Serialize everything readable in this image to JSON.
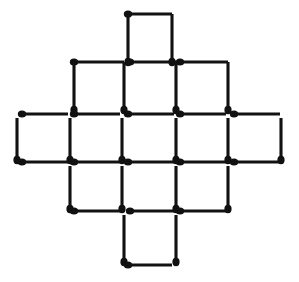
{
  "figure": {
    "title": "Matchstick grid figure",
    "shape_name": "matchstick-diamond-grid",
    "background_color": "#ffffff",
    "match_color": "#121212",
    "head_color": "#111111",
    "canvas": {
      "width": 299,
      "height": 282
    },
    "geometry": {
      "columns_x": [
        20,
        64,
        108,
        152,
        196,
        240,
        284
      ],
      "rows_y": [
        14,
        62,
        114,
        162,
        211,
        265
      ],
      "match_length_h": 44,
      "match_length_v": 44,
      "stick_thickness": 3.1,
      "head_radius_x": 4.2,
      "head_radius_y": 3.6
    },
    "counts": {
      "cells_total": 13,
      "cells_per_row": [
        1,
        3,
        5,
        3,
        1
      ],
      "matches_total": 40
    },
    "matches": [
      {
        "id": "h-r0-c2",
        "orientation": "horizontal",
        "x1": 128,
        "y1": 14,
        "x2": 172,
        "y2": 14,
        "head_at": "start"
      },
      {
        "id": "v-r0-c2-left",
        "orientation": "vertical",
        "x1": 128,
        "y1": 14,
        "x2": 128,
        "y2": 62,
        "head_at": "end"
      },
      {
        "id": "v-r0-c2-right",
        "orientation": "vertical",
        "x1": 172,
        "y1": 14,
        "x2": 172,
        "y2": 62,
        "head_at": "end"
      },
      {
        "id": "h-r1-c1",
        "orientation": "horizontal",
        "x1": 74,
        "y1": 62,
        "x2": 124,
        "y2": 62,
        "head_at": "start"
      },
      {
        "id": "h-r1-c2",
        "orientation": "horizontal",
        "x1": 130,
        "y1": 62,
        "x2": 176,
        "y2": 62,
        "head_at": "start"
      },
      {
        "id": "h-r1-c3",
        "orientation": "horizontal",
        "x1": 180,
        "y1": 62,
        "x2": 228,
        "y2": 62,
        "head_at": "start"
      },
      {
        "id": "v-r1-c1-left",
        "orientation": "vertical",
        "x1": 74,
        "y1": 62,
        "x2": 74,
        "y2": 110,
        "head_at": "end"
      },
      {
        "id": "v-r1-c2-left",
        "orientation": "vertical",
        "x1": 124,
        "y1": 62,
        "x2": 124,
        "y2": 110,
        "head_at": "end"
      },
      {
        "id": "v-r1-c3-left",
        "orientation": "vertical",
        "x1": 176,
        "y1": 62,
        "x2": 176,
        "y2": 110,
        "head_at": "end"
      },
      {
        "id": "v-r1-c3-right",
        "orientation": "vertical",
        "x1": 228,
        "y1": 62,
        "x2": 228,
        "y2": 110,
        "head_at": "end"
      },
      {
        "id": "h-r2-c0",
        "orientation": "horizontal",
        "x1": 22,
        "y1": 114,
        "x2": 68,
        "y2": 114,
        "head_at": "start"
      },
      {
        "id": "h-r2-c1",
        "orientation": "horizontal",
        "x1": 74,
        "y1": 114,
        "x2": 120,
        "y2": 114,
        "head_at": "start"
      },
      {
        "id": "h-r2-c2",
        "orientation": "horizontal",
        "x1": 128,
        "y1": 114,
        "x2": 174,
        "y2": 114,
        "head_at": "start"
      },
      {
        "id": "h-r2-c3",
        "orientation": "horizontal",
        "x1": 180,
        "y1": 114,
        "x2": 226,
        "y2": 114,
        "head_at": "start"
      },
      {
        "id": "h-r2-c4",
        "orientation": "horizontal",
        "x1": 234,
        "y1": 114,
        "x2": 280,
        "y2": 114,
        "head_at": "start"
      },
      {
        "id": "v-r2-c0-left",
        "orientation": "vertical",
        "x1": 17,
        "y1": 118,
        "x2": 17,
        "y2": 160,
        "head_at": "end"
      },
      {
        "id": "v-r2-c1-left",
        "orientation": "vertical",
        "x1": 70,
        "y1": 118,
        "x2": 70,
        "y2": 160,
        "head_at": "end"
      },
      {
        "id": "v-r2-c2-left",
        "orientation": "vertical",
        "x1": 122,
        "y1": 118,
        "x2": 122,
        "y2": 160,
        "head_at": "end"
      },
      {
        "id": "v-r2-c3-left",
        "orientation": "vertical",
        "x1": 176,
        "y1": 118,
        "x2": 176,
        "y2": 160,
        "head_at": "end"
      },
      {
        "id": "v-r2-c4-left",
        "orientation": "vertical",
        "x1": 228,
        "y1": 118,
        "x2": 228,
        "y2": 160,
        "head_at": "end"
      },
      {
        "id": "v-r2-c4-right",
        "orientation": "vertical",
        "x1": 281,
        "y1": 118,
        "x2": 281,
        "y2": 160,
        "head_at": "end"
      },
      {
        "id": "h-r3-c0",
        "orientation": "horizontal",
        "x1": 22,
        "y1": 162,
        "x2": 68,
        "y2": 162,
        "head_at": "start"
      },
      {
        "id": "h-r3-c1",
        "orientation": "horizontal",
        "x1": 74,
        "y1": 162,
        "x2": 120,
        "y2": 162,
        "head_at": "start"
      },
      {
        "id": "h-r3-c2",
        "orientation": "horizontal",
        "x1": 128,
        "y1": 162,
        "x2": 174,
        "y2": 162,
        "head_at": "start"
      },
      {
        "id": "h-r3-c3",
        "orientation": "horizontal",
        "x1": 180,
        "y1": 162,
        "x2": 226,
        "y2": 162,
        "head_at": "start"
      },
      {
        "id": "h-r3-c4",
        "orientation": "horizontal",
        "x1": 234,
        "y1": 162,
        "x2": 280,
        "y2": 162,
        "head_at": "start"
      },
      {
        "id": "v-r3-c1-left",
        "orientation": "vertical",
        "x1": 70,
        "y1": 166,
        "x2": 70,
        "y2": 209,
        "head_at": "end"
      },
      {
        "id": "v-r3-c2-left",
        "orientation": "vertical",
        "x1": 122,
        "y1": 166,
        "x2": 122,
        "y2": 209,
        "head_at": "end"
      },
      {
        "id": "v-r3-c3-left",
        "orientation": "vertical",
        "x1": 176,
        "y1": 166,
        "x2": 176,
        "y2": 209,
        "head_at": "end"
      },
      {
        "id": "v-r3-c3-right",
        "orientation": "vertical",
        "x1": 228,
        "y1": 166,
        "x2": 228,
        "y2": 209,
        "head_at": "end"
      },
      {
        "id": "h-r4-c1",
        "orientation": "horizontal",
        "x1": 74,
        "y1": 211,
        "x2": 124,
        "y2": 211,
        "head_at": "start"
      },
      {
        "id": "h-r4-c2",
        "orientation": "horizontal",
        "x1": 130,
        "y1": 211,
        "x2": 176,
        "y2": 211,
        "head_at": "start"
      },
      {
        "id": "h-r4-c3",
        "orientation": "horizontal",
        "x1": 180,
        "y1": 211,
        "x2": 228,
        "y2": 211,
        "head_at": "start"
      },
      {
        "id": "v-r4-c2-left",
        "orientation": "vertical",
        "x1": 124,
        "y1": 215,
        "x2": 124,
        "y2": 262,
        "head_at": "end"
      },
      {
        "id": "v-r4-c2-right",
        "orientation": "vertical",
        "x1": 176,
        "y1": 215,
        "x2": 176,
        "y2": 262,
        "head_at": "end"
      },
      {
        "id": "h-r5-c2",
        "orientation": "horizontal",
        "x1": 128,
        "y1": 265,
        "x2": 172,
        "y2": 265,
        "head_at": "start"
      }
    ]
  }
}
